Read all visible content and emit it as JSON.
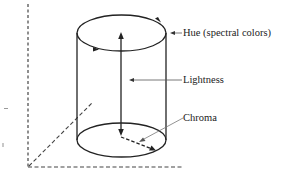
{
  "diagram": {
    "type": "color-space-cylinder",
    "labels": {
      "hue": "Hue (spectral colors)",
      "lightness": "Lightness",
      "chroma": "Chroma"
    },
    "colors": {
      "stroke": "#222222",
      "axis_dashed": "#444444",
      "leader": "#666666",
      "text": "#222222"
    }
  }
}
